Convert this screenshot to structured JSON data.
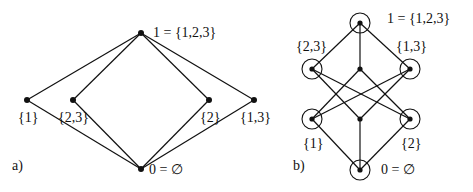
{
  "diagram_a": {
    "panel_label": "a)",
    "top_label": "1 = {1,2,3}",
    "bottom_label": "0 = ∅",
    "nodes": [
      "{1}",
      "{2,3}",
      "{2}",
      "{1,3}"
    ]
  },
  "diagram_b": {
    "panel_label": "b)",
    "top_label": "1 = {1,2,3}",
    "bottom_label": "0 = ∅",
    "upper_left": "{2,3}",
    "upper_right": "{1,3}",
    "lower_left": "{1}",
    "lower_right": "{2}"
  },
  "colors": {
    "line": "#111111",
    "background": "#ffffff"
  }
}
